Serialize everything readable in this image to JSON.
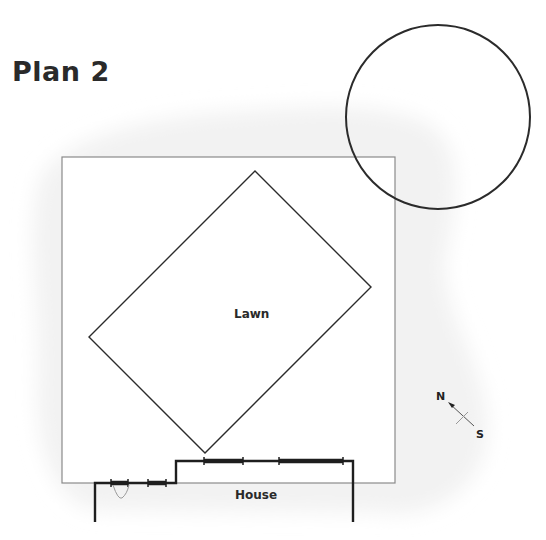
{
  "title": "Plan 2",
  "labels": {
    "lawn": "Lawn",
    "house": "House"
  },
  "compass": {
    "north": "N",
    "south": "S"
  },
  "colors": {
    "shade": "#f3f3f3",
    "boundary": "#8a8a8a",
    "outline": "#2b2b2b",
    "text": "#2a2a2a"
  }
}
